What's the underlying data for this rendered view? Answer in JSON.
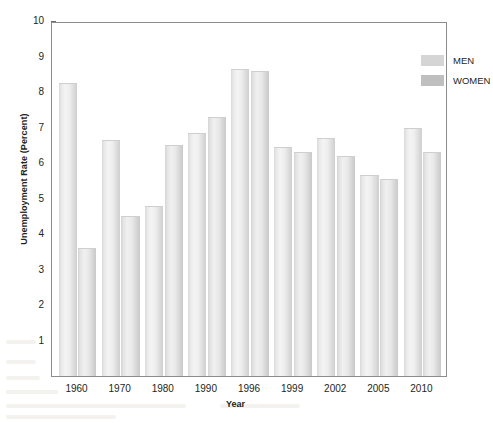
{
  "chart_data": {
    "type": "bar",
    "title": "",
    "xlabel": "Year",
    "ylabel": "Unemployment Rate (Percent)",
    "categories": [
      "1960",
      "1970",
      "1980",
      "1990",
      "1996",
      "1999",
      "2002",
      "2005",
      "2010"
    ],
    "series": [
      {
        "name": "MEN",
        "color": "#d5d5d5",
        "values": [
          8.25,
          6.65,
          4.8,
          6.85,
          8.65,
          6.45,
          6.7,
          5.65,
          7.0
        ]
      },
      {
        "name": "WOMEN",
        "color": "#bfbfbf",
        "values": [
          3.6,
          4.5,
          6.5,
          7.3,
          8.6,
          6.3,
          6.2,
          5.55,
          6.3
        ]
      }
    ],
    "ylim": [
      0,
      10
    ],
    "y_ticks": [
      "1",
      "2",
      "3",
      "4",
      "5",
      "6",
      "7",
      "8",
      "9",
      "10"
    ],
    "grid": false,
    "legend_position": "top-right"
  },
  "legend": {
    "items": [
      {
        "label": "MEN"
      },
      {
        "label": "WOMEN"
      }
    ]
  },
  "axes": {
    "x_title": "Year",
    "y_title": "Unemployment Rate (Percent)"
  }
}
